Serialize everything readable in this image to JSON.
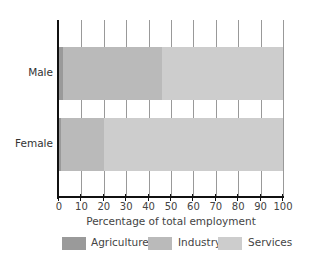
{
  "chart_data": {
    "type": "bar",
    "orientation": "horizontal",
    "stacked": true,
    "title": "",
    "categories": [
      "Male",
      "Female"
    ],
    "series": [
      {
        "name": "Agriculture",
        "values": [
          2,
          1
        ],
        "color": "#9a9a9a"
      },
      {
        "name": "Industry",
        "values": [
          44,
          19
        ],
        "color": "#bababa"
      },
      {
        "name": "Services",
        "values": [
          54,
          80
        ],
        "color": "#cdcdcd"
      }
    ],
    "xlabel": "Percentage of total employment",
    "ylabel": "",
    "xlim": [
      0,
      100
    ],
    "xticks": [
      "0",
      "10",
      "20",
      "30",
      "40",
      "50",
      "60",
      "70",
      "80",
      "90",
      "100"
    ],
    "grid": true,
    "legend_position": "bottom"
  }
}
